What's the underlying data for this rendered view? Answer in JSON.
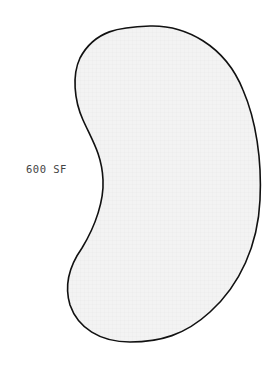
{
  "diagram": {
    "area_label": "600 SF",
    "shape": "kidney-shaped outline",
    "fill_color": "#f2f2f2",
    "stroke_color": "#111111"
  }
}
